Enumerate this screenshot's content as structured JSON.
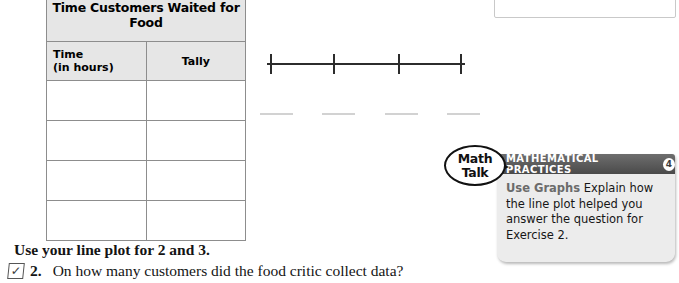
{
  "table": {
    "title": "Time Customers Waited for Food",
    "columns": [
      "Time (in hours)",
      "Tally"
    ],
    "column_line1": "Time",
    "column_line2": "(in hours)",
    "column2": "Tally",
    "rows": [
      {
        "time": "",
        "tally": ""
      },
      {
        "time": "",
        "tally": ""
      },
      {
        "time": "",
        "tally": ""
      },
      {
        "time": "",
        "tally": ""
      }
    ],
    "header_bg": "#e6e6e6",
    "border_color": "#8d8d8d"
  },
  "line_plot": {
    "tick_count": 4,
    "tick_positions": [
      10,
      73,
      138,
      200
    ],
    "label_blanks": 4,
    "label_blank_positions": [
      0,
      62,
      125,
      187
    ],
    "axis_color": "#2c2c2c",
    "labels": [
      "",
      "",
      "",
      ""
    ]
  },
  "math_talk": {
    "line1": "Math",
    "line2": "Talk"
  },
  "mathematical_practices": {
    "header": "MATHEMATICAL PRACTICES",
    "badge": "4",
    "lead": "Use Graphs",
    "body": " Explain how the line plot helped you answer the question for Exercise 2.",
    "header_color": "#4a4a4a",
    "panel_color": "#ececec",
    "lead_color": "#6b6b6b"
  },
  "bottom": {
    "instruction": "Use your line plot for 2 and 3.",
    "check_glyph": "✓",
    "question_number": "2.",
    "question_text": "On how many customers did the food critic collect data?"
  }
}
